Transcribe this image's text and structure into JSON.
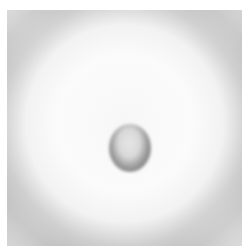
{
  "image": {
    "description": "Grayscale photograph of a circular clear zone with a small dark-rimmed disk at center",
    "colors": {
      "background": "#ffffff",
      "outer_gray": "#bdbdbd",
      "clear_zone": "#fbfbfb",
      "disk_rim": "#8a8a8a",
      "disk_center": "#e6e6e6"
    }
  }
}
